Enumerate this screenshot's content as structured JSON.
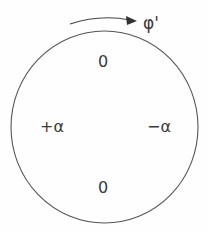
{
  "diagram": {
    "rotation_label": "φ'",
    "labels": {
      "top": "0",
      "left": "+α",
      "right": "−α",
      "bottom": "0"
    },
    "stroke_color": "#555555"
  }
}
